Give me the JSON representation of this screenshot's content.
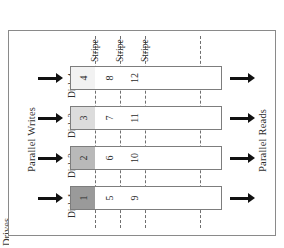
{
  "figure": {
    "left_caption": "Parallel Writes",
    "right_caption": "Parallel Reads",
    "edge_caption": "Drives"
  },
  "stripes": [
    {
      "label": "Stripe"
    },
    {
      "label": "Stripe"
    },
    {
      "label": "Stripe"
    }
  ],
  "disks": [
    {
      "name": "Disk 4",
      "blocks": [
        "4",
        "8",
        "12"
      ],
      "first_block_fill": "#f2f2f2"
    },
    {
      "name": "Disk 3",
      "blocks": [
        "3",
        "7",
        "11"
      ],
      "first_block_fill": "#dcdcdc"
    },
    {
      "name": "Disk 2",
      "blocks": [
        "2",
        "6",
        "10"
      ],
      "first_block_fill": "#b9b9b9"
    },
    {
      "name": "Disk 1",
      "blocks": [
        "1",
        "5",
        "9"
      ],
      "first_block_fill": "#9a9a9a"
    }
  ],
  "colors": {
    "frame": "#8a8a8a",
    "bar_border": "#7d7d7d",
    "dashed": "#6f6f6f",
    "arrow": "#111111",
    "text": "#2f2f2f",
    "background": "#ffffff"
  }
}
